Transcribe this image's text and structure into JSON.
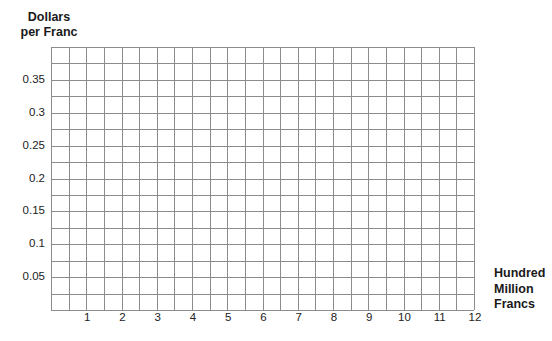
{
  "chart_data": {
    "type": "line",
    "title": "",
    "xlabel": "Hundred Million Francs",
    "ylabel": "Dollars per Franc",
    "xlabel_lines": [
      "Hundred",
      "Million",
      "Francs"
    ],
    "ylabel_lines": [
      "Dollars",
      "per Franc"
    ],
    "x_ticks": [
      "1",
      "2",
      "3",
      "4",
      "5",
      "6",
      "7",
      "8",
      "9",
      "10",
      "11",
      "12"
    ],
    "y_ticks": [
      "0.05",
      "0.1",
      "0.15",
      "0.2",
      "0.25",
      "0.3",
      "0.35"
    ],
    "xlim": [
      0,
      12
    ],
    "ylim": [
      0,
      0.4
    ],
    "x_grid_step": 0.5,
    "y_grid_step": 0.025,
    "grid": true,
    "series": [],
    "legend": null
  },
  "style": {
    "grid_color": "#8c8c8c",
    "text_color": "#1a1a1a",
    "background": "#ffffff"
  }
}
